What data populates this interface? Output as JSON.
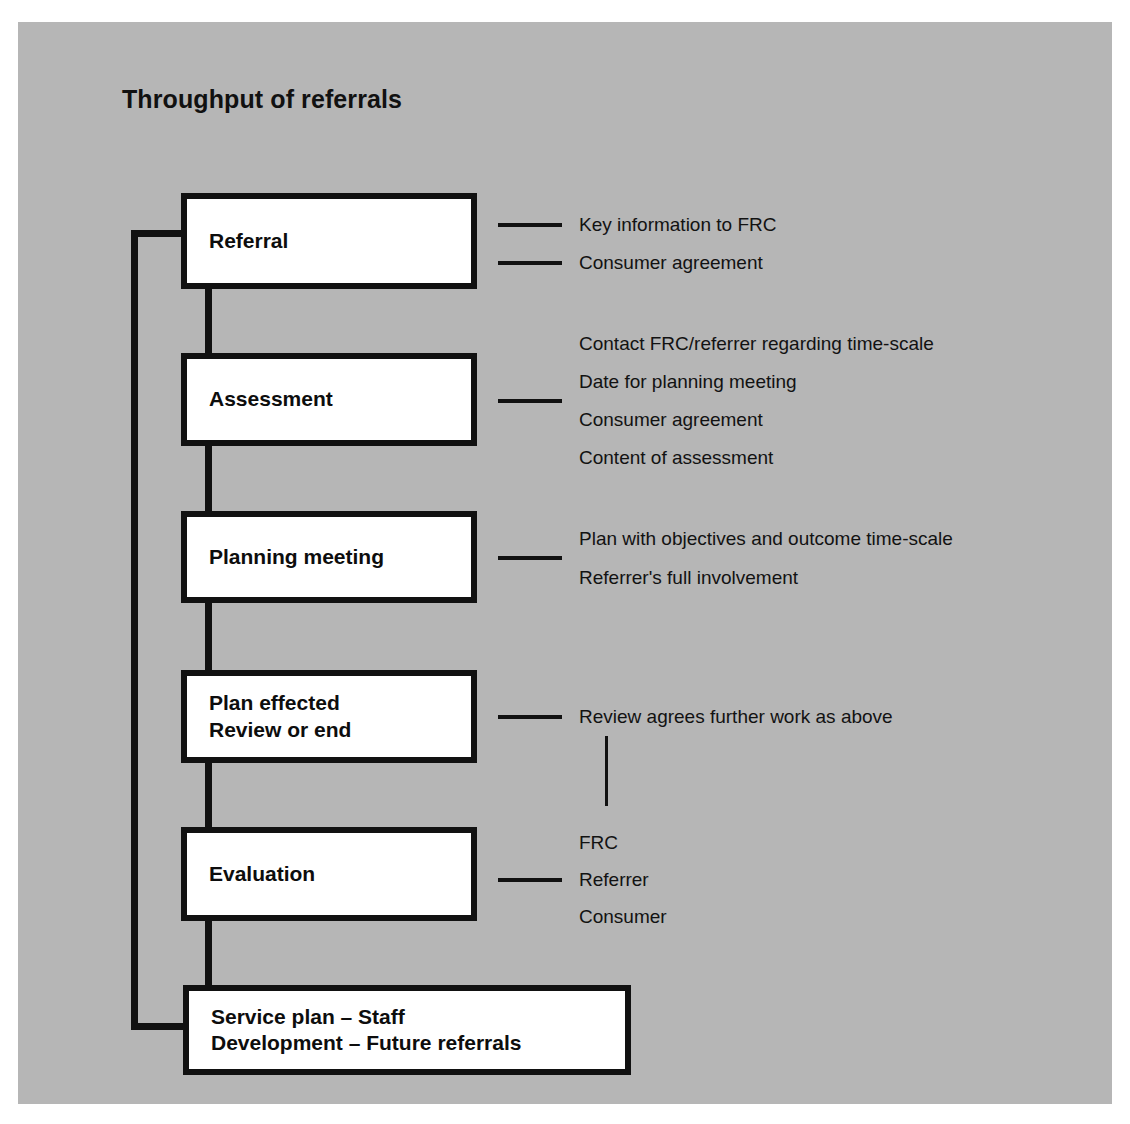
{
  "figure": {
    "title": "Throughput of referrals",
    "background_color": "#b6b6b6",
    "box_fill_color": "#ffffff",
    "line_color": "#111111"
  },
  "flow": {
    "boxes": [
      {
        "id": "referral",
        "label": "Referral"
      },
      {
        "id": "assessment",
        "label": "Assessment"
      },
      {
        "id": "planning",
        "label": "Planning meeting"
      },
      {
        "id": "plan-effected",
        "label": "Plan effected\nReview or end"
      },
      {
        "id": "evaluation",
        "label": "Evaluation"
      },
      {
        "id": "service-plan",
        "label": "Service plan – Staff\nDevelopment – Future referrals"
      }
    ]
  },
  "annotations": {
    "referral": [
      "Key information to FRC",
      "Consumer agreement"
    ],
    "assessment": [
      "Contact FRC/referrer regarding time-scale",
      "Date for planning meeting",
      "Consumer agreement",
      "Content of assessment"
    ],
    "planning": [
      "Plan with objectives and outcome time-scale",
      "Referrer's full involvement"
    ],
    "plan_effected": [
      "Review agrees further work as above"
    ],
    "evaluation": [
      "FRC",
      "Referrer",
      "Consumer"
    ]
  }
}
